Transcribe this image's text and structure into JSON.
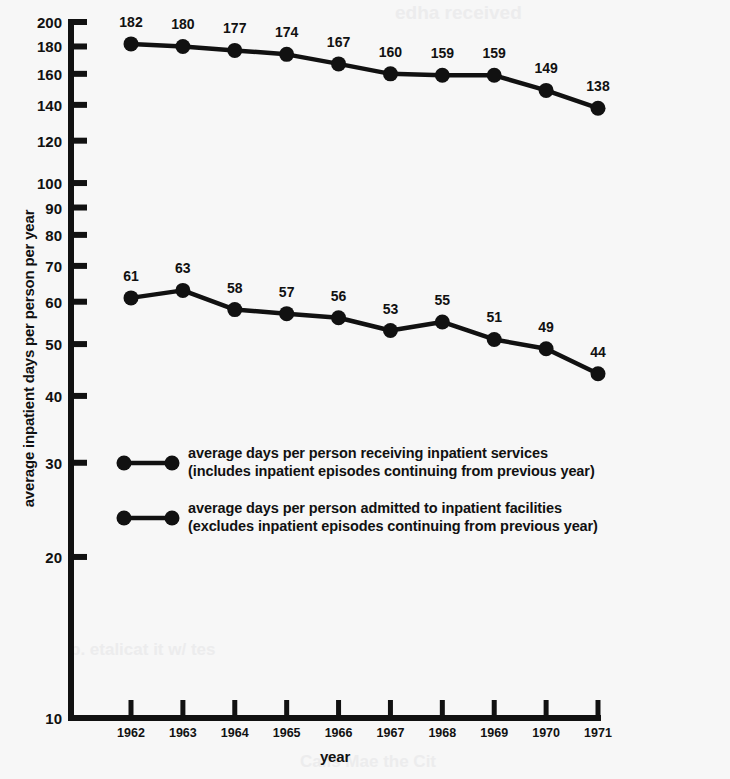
{
  "chart_data": {
    "type": "line",
    "title": "",
    "xlabel": "year",
    "ylabel": "average inpatient days per person per year",
    "x": [
      "1962",
      "1963",
      "1964",
      "1965",
      "1966",
      "1967",
      "1968",
      "1969",
      "1970",
      "1971"
    ],
    "categories": [
      "1962",
      "1963",
      "1964",
      "1965",
      "1966",
      "1967",
      "1968",
      "1969",
      "1970",
      "1971"
    ],
    "yscale": "log",
    "ylim": [
      10,
      200
    ],
    "yticks": [
      200,
      180,
      160,
      140,
      120,
      100,
      90,
      80,
      70,
      60,
      50,
      40,
      30,
      20,
      10
    ],
    "ytick_labels": [
      "200",
      "180",
      "160",
      "140",
      "120",
      "100",
      "90",
      "80",
      "70",
      "60",
      "50",
      "40",
      "30",
      "20",
      "10"
    ],
    "grid": false,
    "legend_position": "inside-center-left",
    "series": [
      {
        "name": "average days per person receiving inpatient services",
        "note": "(includes inpatient episodes continuing from previous year)",
        "values": [
          182,
          180,
          177,
          174,
          167,
          160,
          159,
          159,
          149,
          138
        ],
        "labels": [
          "182",
          "180",
          "177",
          "174",
          "167",
          "160",
          "159",
          "159",
          "149",
          "138"
        ],
        "color": "#111111",
        "marker": "circle"
      },
      {
        "name": "average days per person admitted to inpatient facilities",
        "note": "(excludes inpatient episodes continuing from previous year)",
        "values": [
          61,
          63,
          58,
          57,
          56,
          53,
          55,
          51,
          49,
          44
        ],
        "labels": [
          "61",
          "63",
          "58",
          "57",
          "56",
          "53",
          "55",
          "51",
          "49",
          "44"
        ],
        "color": "#111111",
        "marker": "circle"
      }
    ]
  },
  "axes": {
    "y_title": "average inpatient days per person per year",
    "x_title": "year"
  },
  "legend": {
    "entries": [
      {
        "line1": "average days per person receiving inpatient services",
        "line2": "(includes inpatient episodes continuing from previous year)"
      },
      {
        "line1": "average days per person admitted to inpatient facilities",
        "line2": "(excludes inpatient episodes continuing from previous year)"
      }
    ]
  },
  "artifacts": {
    "top": "edha received",
    "bottom_left": "p. etalicat  it  w/ tes",
    "bottom_right": "Calls  Mae the Cit"
  },
  "colors": {
    "ink": "#111111",
    "paper": "#f7f7f7",
    "artifact": "#ececed"
  }
}
